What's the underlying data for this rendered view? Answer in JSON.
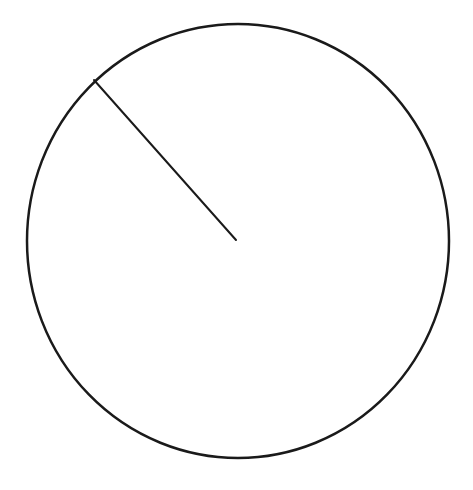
{
  "diagram": {
    "type": "circle-with-radius",
    "shapes": [
      {
        "kind": "circle",
        "label": "",
        "stroke": "#1a1a1a",
        "fill": "none"
      },
      {
        "kind": "radius-line",
        "label": "",
        "stroke": "#1a1a1a",
        "direction": "upper-left",
        "angle_deg": 132
      }
    ],
    "background": "#ffffff",
    "text_labels": []
  }
}
